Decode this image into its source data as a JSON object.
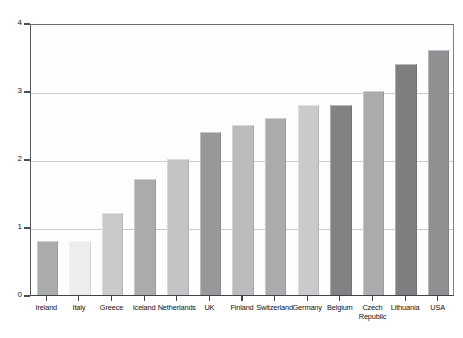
{
  "chart_data": {
    "type": "bar",
    "title": "",
    "xlabel": "",
    "ylabel": "number of annual divorces per 1,000 population",
    "ylim": [
      0,
      4
    ],
    "yticks": [
      0,
      1,
      2,
      3,
      4
    ],
    "ytick_labels": [
      "0",
      "1",
      "2",
      "3",
      "4"
    ],
    "grid": true,
    "legend": "none",
    "categories": [
      "Ireland",
      "Italy",
      "Greece",
      "Iceland",
      "Netherlands",
      "UK",
      "Finland",
      "Switzerland",
      "Germany",
      "Belgium",
      "Czech Republic",
      "Lithuania",
      "USA"
    ],
    "category_lines": [
      [
        "Ireland"
      ],
      [
        "Italy"
      ],
      [
        "Greece"
      ],
      [
        "Iceland"
      ],
      [
        "Netherlands"
      ],
      [
        "UK"
      ],
      [
        "Finland"
      ],
      [
        "Switzerland"
      ],
      [
        "Germany"
      ],
      [
        "Belgium"
      ],
      [
        "Czech",
        "Republic"
      ],
      [
        "Lithuania"
      ],
      [
        "USA"
      ]
    ],
    "values": [
      0.8,
      0.8,
      1.2,
      1.7,
      2.0,
      2.4,
      2.5,
      2.6,
      2.8,
      2.8,
      3.0,
      3.4,
      3.6
    ],
    "bar_colors": [
      "#a9abad",
      "#ededed",
      "#c8cacb",
      "#a9abad",
      "#c2c4c5",
      "#969899",
      "#b9bbbc",
      "#a9abad",
      "#c8cacb",
      "#808284",
      "#a9abad",
      "#7d7f81",
      "#8e9092"
    ]
  },
  "axis": {
    "y_title": "number of annual divorces per 1,000 population",
    "frame_color": "#4a4e52",
    "gridline_color": "#c9ccce",
    "background": "#fdfdfd"
  }
}
